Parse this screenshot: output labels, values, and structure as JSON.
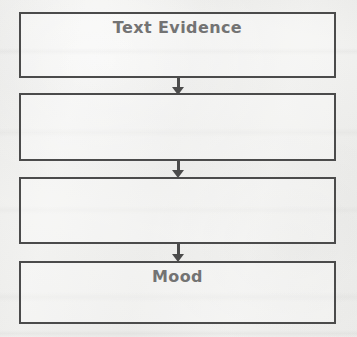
{
  "worksheet": {
    "type": "flow-chart",
    "orientation": "vertical",
    "background_color": "#f2f2f0",
    "border_color": "#4b4b4b",
    "text_color": "#737373",
    "boxes": [
      {
        "label": "Text Evidence",
        "filled": true
      },
      {
        "label": "",
        "filled": false
      },
      {
        "label": "",
        "filled": false
      },
      {
        "label": "Mood",
        "filled": true
      }
    ],
    "arrows": [
      {
        "direction": "down",
        "from": "Text Evidence",
        "to": ""
      },
      {
        "direction": "down",
        "from": "",
        "to": ""
      },
      {
        "direction": "down",
        "from": "",
        "to": "Mood"
      }
    ]
  }
}
